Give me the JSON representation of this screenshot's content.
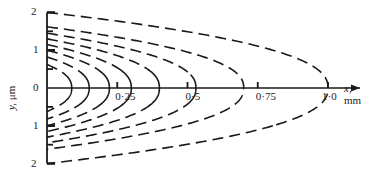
{
  "figure": {
    "background_color": "#ffffff",
    "line_color": "#1a1a1a",
    "width": 379,
    "height": 174
  },
  "axes": {
    "x_axis": {
      "title_var": "x,",
      "title_unit": "mm",
      "tick_labels": [
        "0·25",
        "0·5",
        "0·75",
        "1·0"
      ],
      "tick_values": [
        0.25,
        0.5,
        0.75,
        1.0
      ],
      "range": [
        0,
        1.12
      ],
      "arrow": true
    },
    "y_axis": {
      "title_var": "y,",
      "title_unit": "μm",
      "tick_labels": [
        "2",
        "1",
        "0",
        "1",
        "2"
      ],
      "tick_values": [
        2,
        1,
        0,
        -1,
        -2
      ],
      "range": [
        -2,
        2
      ],
      "minor_ticks": [
        1.5,
        0.5,
        -0.5,
        -1.5
      ]
    }
  },
  "chart_data": {
    "type": "line",
    "title": "",
    "xlabel": "x, mm",
    "ylabel": "y, μm",
    "xlim": [
      0,
      1.12
    ],
    "ylim": [
      -2,
      2
    ],
    "grid": false,
    "legend": null,
    "series": [
      {
        "name": "contour-1",
        "vertex_x": 0.088,
        "y_at_axis": 0.62,
        "dash_fraction": 0.34
      },
      {
        "name": "contour-2",
        "vertex_x": 0.15,
        "y_at_axis": 0.82,
        "dash_fraction": 0.36
      },
      {
        "name": "contour-3",
        "vertex_x": 0.222,
        "y_at_axis": 1.0,
        "dash_fraction": 0.38
      },
      {
        "name": "contour-4",
        "vertex_x": 0.3,
        "y_at_axis": 1.15,
        "dash_fraction": 0.4
      },
      {
        "name": "contour-5",
        "vertex_x": 0.4,
        "y_at_axis": 1.3,
        "dash_fraction": 0.42
      },
      {
        "name": "contour-6",
        "vertex_x": 0.53,
        "y_at_axis": 1.45,
        "dash_fraction": 0.46
      },
      {
        "name": "contour-7",
        "vertex_x": 0.7,
        "y_at_axis": 1.62,
        "dash_fraction": 0.52
      },
      {
        "name": "contour-8",
        "vertex_x": 1.0,
        "y_at_axis": 2.0,
        "dash_fraction": 0.62
      }
    ]
  }
}
